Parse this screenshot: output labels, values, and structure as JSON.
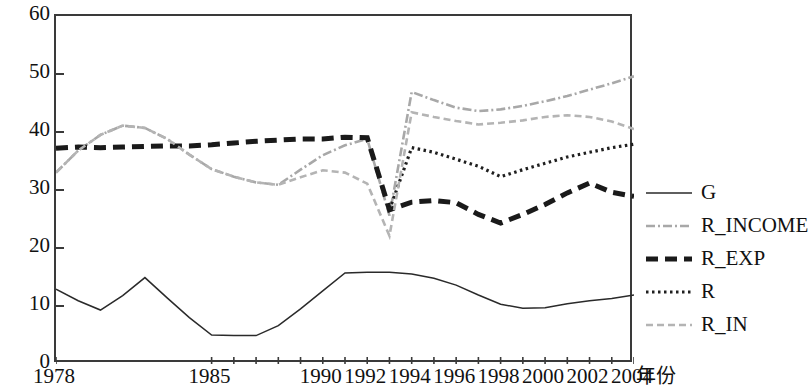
{
  "chart_data": {
    "type": "line",
    "title": "",
    "subtitle": "",
    "xlabel": "年份",
    "ylabel": "",
    "xlim": [
      1978,
      2004
    ],
    "ylim": [
      0,
      60
    ],
    "grid": false,
    "legend_position": "right",
    "y_ticks": [
      0,
      10,
      20,
      30,
      40,
      50,
      60
    ],
    "x_tick_labels": [
      "1978",
      "1985",
      "1990",
      "1992",
      "1994",
      "1996",
      "1998",
      "2000",
      "2002",
      "2004"
    ],
    "x_tick_values": [
      1978,
      1985,
      1990,
      1992,
      1994,
      1996,
      1998,
      2000,
      2002,
      2004
    ],
    "x": [
      1978,
      1979,
      1980,
      1981,
      1982,
      1983,
      1984,
      1985,
      1986,
      1987,
      1988,
      1989,
      1990,
      1991,
      1992,
      1993,
      1994,
      1995,
      1996,
      1997,
      1998,
      1999,
      2000,
      2001,
      2002,
      2003,
      2004
    ],
    "series": [
      {
        "name": "G",
        "style": "solid-thin",
        "color": "#2a2a2a",
        "values": [
          12.9,
          10.9,
          9.3,
          11.8,
          14.9,
          11.4,
          8.0,
          5.0,
          4.9,
          4.9,
          6.6,
          9.5,
          12.6,
          15.7,
          15.8,
          15.8,
          15.5,
          14.8,
          13.6,
          11.9,
          10.3,
          9.6,
          9.7,
          10.4,
          10.9,
          11.3,
          11.9
        ],
        "point_labels": []
      },
      {
        "name": "R_INCOME",
        "style": "dash-dot-light",
        "color": "#a8a8a8",
        "values": [
          33.0,
          36.8,
          39.5,
          41.1,
          40.7,
          38.8,
          36.1,
          33.6,
          32.3,
          31.3,
          30.9,
          33.5,
          36.0,
          37.7,
          38.8,
          25.6,
          46.9,
          45.5,
          44.2,
          43.6,
          43.9,
          44.5,
          45.3,
          46.2,
          47.3,
          48.4,
          49.6
        ],
        "point_labels": []
      },
      {
        "name": "R_EXP",
        "style": "dashed-thick",
        "color": "#1a1a1a",
        "values": [
          37.2,
          37.4,
          37.3,
          37.4,
          37.5,
          37.6,
          37.6,
          37.8,
          38.1,
          38.4,
          38.6,
          38.8,
          38.8,
          39.1,
          39.0,
          26.6,
          27.9,
          28.2,
          27.8,
          25.8,
          24.3,
          25.8,
          27.5,
          29.5,
          31.2,
          29.6,
          28.9
        ],
        "point_labels": []
      },
      {
        "name": "R",
        "style": "dotted",
        "color": "#1f1f1f",
        "values": [
          null,
          null,
          null,
          null,
          null,
          null,
          null,
          null,
          null,
          null,
          null,
          null,
          null,
          null,
          null,
          26.6,
          37.3,
          36.5,
          35.3,
          34.1,
          32.3,
          33.5,
          34.6,
          35.7,
          36.5,
          37.3,
          37.9
        ],
        "point_labels": []
      },
      {
        "name": "R_IN",
        "style": "dashed-light",
        "color": "#b4b4b4",
        "values": [
          33.0,
          36.8,
          39.5,
          41.1,
          40.7,
          38.8,
          36.1,
          33.6,
          32.3,
          31.3,
          30.9,
          32.2,
          33.4,
          33.0,
          31.1,
          22.1,
          43.4,
          42.6,
          41.9,
          41.3,
          41.6,
          42.0,
          42.6,
          42.9,
          42.6,
          41.8,
          40.5
        ],
        "point_labels": []
      }
    ]
  },
  "legend": {
    "items": [
      {
        "label": "G",
        "swatch": "legend-swatch-solid-thin"
      },
      {
        "label": "R_INCOME",
        "swatch": "legend-swatch-dash-dot-light"
      },
      {
        "label": "R_EXP",
        "swatch": "legend-swatch-dashed-thick"
      },
      {
        "label": "R",
        "swatch": "legend-swatch-dotted"
      },
      {
        "label": "R_IN",
        "swatch": "legend-swatch-dashed-light"
      }
    ]
  }
}
